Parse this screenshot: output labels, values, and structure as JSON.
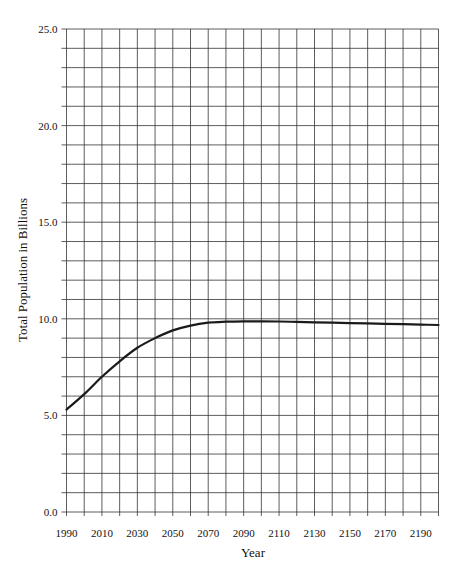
{
  "chart_data": {
    "type": "line",
    "title": "",
    "xlabel": "Year",
    "ylabel": "Total Population in Billions",
    "xlim": [
      1990,
      2200
    ],
    "ylim": [
      0,
      25
    ],
    "grid": true,
    "x_grid_step": 10,
    "y_grid_step": 1,
    "x_tick_labels": [
      "1990",
      "2010",
      "2030",
      "2050",
      "2070",
      "2090",
      "2110",
      "2130",
      "2150",
      "2170",
      "2190"
    ],
    "y_tick_labels": [
      "0.0",
      "5.0",
      "10.0",
      "15.0",
      "20.0",
      "25.0"
    ],
    "legend": null,
    "series": [
      {
        "name": "Total Population",
        "color": "#1a1a1a",
        "x": [
          1990,
          2000,
          2010,
          2020,
          2030,
          2040,
          2050,
          2060,
          2070,
          2080,
          2090,
          2100,
          2110,
          2120,
          2130,
          2140,
          2150,
          2160,
          2170,
          2180,
          2190,
          2200
        ],
        "values": [
          5.3,
          6.1,
          7.0,
          7.8,
          8.5,
          9.0,
          9.4,
          9.65,
          9.8,
          9.85,
          9.87,
          9.87,
          9.86,
          9.84,
          9.82,
          9.8,
          9.78,
          9.76,
          9.74,
          9.72,
          9.7,
          9.68
        ]
      }
    ]
  }
}
